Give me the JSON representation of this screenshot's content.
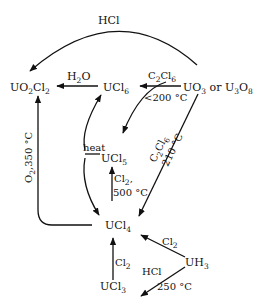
{
  "diagram": {
    "type": "chemical-reaction-scheme",
    "nodes": {
      "uo2cl2": {
        "base": "UO",
        "s1": "2",
        "mid": "Cl",
        "s2": "2"
      },
      "ucl6": {
        "base": "UCl",
        "s1": "6"
      },
      "uo3": {
        "base": "UO",
        "s1": "3",
        "mid": " or U",
        "s2": "3",
        "end": "O",
        "s3": "8"
      },
      "ucl5": {
        "base": "UCl",
        "s1": "5"
      },
      "ucl4": {
        "base": "UCl",
        "s1": "4"
      },
      "uh3": {
        "base": "UH",
        "s1": "3"
      },
      "ucl3": {
        "base": "UCl",
        "s1": "3"
      }
    },
    "edges": {
      "uo3_to_uo2cl2": {
        "reagent": "HCl"
      },
      "ucl6_to_uo2cl2": {
        "reagent_base": "H",
        "reagent_sub": "2",
        "reagent_end": "O"
      },
      "uo3_to_ucl6": {
        "reagent_base": "C",
        "reagent_sub1": "2",
        "reagent_mid": "Cl",
        "reagent_sub2": "6"
      },
      "uo3_to_ucl5": {
        "condition": "<200 °C"
      },
      "ucl5_heat": {
        "label": "heat"
      },
      "ucl4_to_ucl5": {
        "reagent_base": "Cl",
        "reagent_sub": "2",
        "reagent_end": ",",
        "condition": "500 °C"
      },
      "uo3_to_ucl4": {
        "reagent_base": "C",
        "reagent_sub1": "2",
        "reagent_mid": "Cl",
        "reagent_sub2": "6",
        "condition": "210 °C"
      },
      "ucl4_to_uo2cl2": {
        "reagent_base": "O",
        "reagent_sub": "2",
        "condition": ",350 °C"
      },
      "uh3_to_ucl4": {
        "reagent_base": "Cl",
        "reagent_sub": "2"
      },
      "ucl3_to_ucl4": {
        "reagent_base": "Cl",
        "reagent_sub": "2"
      },
      "uh3_to_ucl3": {
        "reagent": "HCl",
        "condition": "250 °C"
      }
    },
    "colors": {
      "ink": "#111111",
      "background": "#ffffff"
    }
  }
}
